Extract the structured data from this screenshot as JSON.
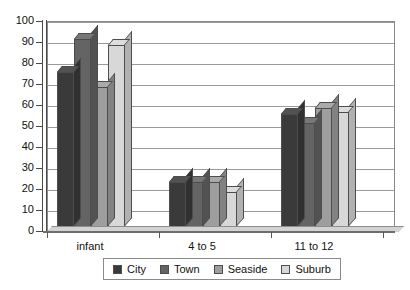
{
  "chart_data": {
    "type": "bar",
    "title": "",
    "subtitle": "",
    "xlabel": "",
    "ylabel": "",
    "categories": [
      "infant",
      "4 to 5",
      "11 to 12"
    ],
    "ylim": [
      0,
      100
    ],
    "y_ticks": [
      0,
      10,
      20,
      30,
      40,
      50,
      60,
      70,
      80,
      90,
      100
    ],
    "grid": true,
    "legend_position": "bottom",
    "style": "3d-clustered-column-grayscale",
    "series": [
      {
        "name": "City",
        "color": "#3a3a3a",
        "values": [
          76,
          24,
          56
        ]
      },
      {
        "name": "Town",
        "color": "#646464",
        "values": [
          92,
          24,
          52
        ]
      },
      {
        "name": "Seaside",
        "color": "#9e9e9e",
        "values": [
          69,
          24,
          59
        ]
      },
      {
        "name": "Suburb",
        "color": "#d8d8d8",
        "values": [
          89,
          19,
          57
        ]
      }
    ]
  },
  "axis": {
    "y_tick_labels": [
      "100",
      "90",
      "80",
      "70",
      "60",
      "50",
      "40",
      "30",
      "20",
      "10",
      "0"
    ]
  },
  "legend": {
    "items": [
      {
        "label": "City",
        "swatch": "#3a3a3a"
      },
      {
        "label": "Town",
        "swatch": "#646464"
      },
      {
        "label": "Seaside",
        "swatch": "#9e9e9e"
      },
      {
        "label": "Suburb",
        "swatch": "#d8d8d8"
      }
    ]
  }
}
